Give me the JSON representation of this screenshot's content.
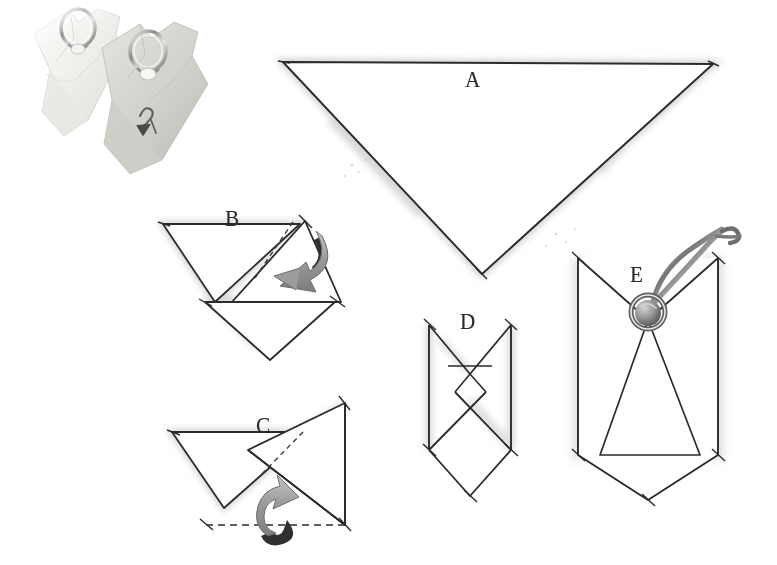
{
  "illustration": {
    "title": "Napkin folding instructions",
    "medium": "pencil drawing with photograph",
    "background_color": "#ffffff",
    "ink_color": "#2b2b2b",
    "shade_color": "#b9b9b9",
    "arrow_fill": "#9a9a9a",
    "arrow_dark": "#2f2f2f"
  },
  "photo": {
    "name": "two folded napkins with napkin rings",
    "napkins": [
      {
        "label": "white napkin with silver ring",
        "color": "#f2f2f0"
      },
      {
        "label": "gray napkin with monogram and silver ring",
        "color": "#d8d8d4"
      }
    ]
  },
  "steps": [
    {
      "id": "A",
      "label": "A",
      "caption": "Fold napkin into a large triangle, point down",
      "label_x": 465,
      "label_y": 67
    },
    {
      "id": "B",
      "label": "B",
      "caption": "Fold right flap across to the left",
      "label_x": 225,
      "label_y": 206,
      "arrow": {
        "direction": "left",
        "style": "curved-3d"
      }
    },
    {
      "id": "C",
      "label": "C",
      "caption": "Fold bottom point up along dashed line",
      "label_x": 256,
      "label_y": 413,
      "arrow": {
        "direction": "up",
        "style": "curved-3d"
      }
    },
    {
      "id": "D",
      "label": "D",
      "caption": "Fold both sides inward to form a narrow band",
      "label_x": 460,
      "label_y": 309
    },
    {
      "id": "E",
      "label": "E",
      "caption": "Slip the napkin through the napkin ring",
      "label_x": 630,
      "label_y": 262
    }
  ]
}
